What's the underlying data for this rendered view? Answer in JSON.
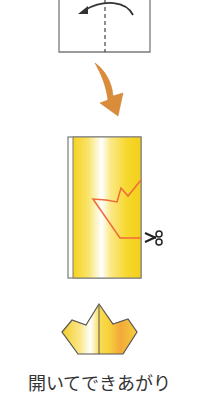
{
  "diagram": {
    "steps": [
      {
        "name": "fold-in-half",
        "description": "Fold the paper in half along the dashed center line",
        "fold_direction": "right-to-left"
      },
      {
        "name": "cut-crown-shape",
        "description": "Cut along the red line with scissors",
        "cut_tool": "scissors"
      },
      {
        "name": "finished-crown",
        "description": "Open it up and done"
      }
    ],
    "caption": "開いてできあがり",
    "icons": {
      "fold_arrow": "curved-arrow-left-icon",
      "step_arrow": "down-arrow-icon",
      "cut_tool": "scissors-icon",
      "crown": "crown-icon"
    },
    "colors": {
      "outline": "#7a7a7a",
      "fold_arrow": "#333333",
      "step_arrow": "#d98c3a",
      "cut_line": "#ef6a3a",
      "paper_yellow": "#f7d21a",
      "paper_light": "#ffffff",
      "paper_orange": "#f2a93b",
      "caption_text": "#333333"
    }
  }
}
